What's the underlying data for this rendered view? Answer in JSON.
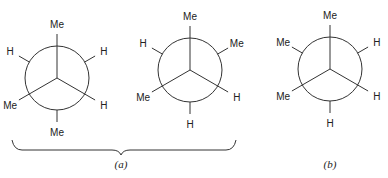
{
  "projections": [
    {
      "id": "a1",
      "front": {
        "up": "Me",
        "lower_left": "Me",
        "lower_right": "H"
      },
      "back": {
        "upper_left": "H",
        "upper_right": "H",
        "down": "Me"
      }
    },
    {
      "id": "a2",
      "front": {
        "up": "Me",
        "lower_left": "Me",
        "lower_right": "H"
      },
      "back": {
        "upper_left": "H",
        "upper_right": "Me",
        "down": "H"
      }
    },
    {
      "id": "b",
      "front": {
        "up": "Me",
        "lower_left": "Me",
        "lower_right": "H"
      },
      "back": {
        "upper_left": "Me",
        "upper_right": "H",
        "down": "H"
      }
    }
  ],
  "captions": {
    "a": "(a)",
    "b": "(b)"
  }
}
